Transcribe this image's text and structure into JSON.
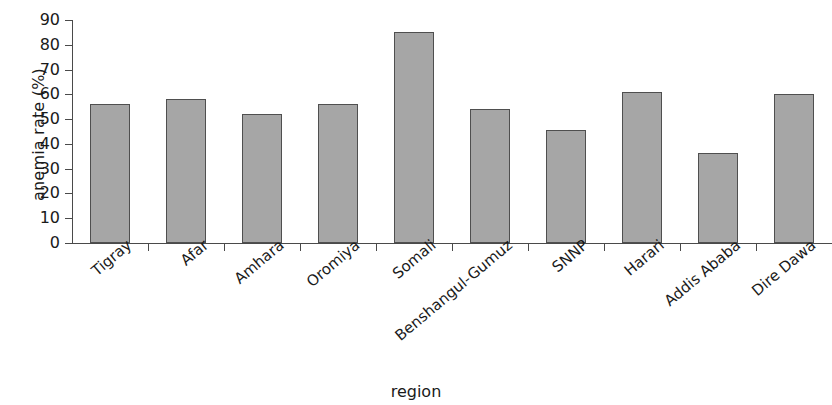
{
  "chart_data": {
    "type": "bar",
    "title": "",
    "xlabel": "region",
    "ylabel": "anemia rate (%)",
    "categories": [
      "Tigray",
      "Afar",
      "Amhara",
      "Oromiya",
      "Somali",
      "Benshangul-Gumuz",
      "SNNP",
      "Harari",
      "Addis Ababa",
      "Dire Dawa"
    ],
    "values": [
      56,
      58,
      52,
      56,
      85,
      54,
      45.5,
      61,
      36.5,
      60
    ],
    "ylim": [
      0,
      90
    ],
    "ytick_labels": [
      "0",
      "10",
      "20",
      "30",
      "40",
      "50",
      "60",
      "70",
      "80",
      "90"
    ],
    "ytick_values": [
      0,
      10,
      20,
      30,
      40,
      50,
      60,
      70,
      80,
      90
    ],
    "grid": false,
    "legend": null,
    "bar_color": "#a6a6a6",
    "bar_edge_color": "#4f4f4f",
    "axis_color": "#4a4a4a",
    "text_color": "#1a1a1a",
    "xtick_label_rotation": -40
  }
}
